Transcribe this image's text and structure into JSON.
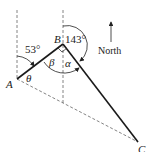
{
  "diagram": {
    "points": {
      "A": {
        "label": "A",
        "x": 17,
        "y": 79
      },
      "B": {
        "label": "B",
        "x": 63,
        "y": 44
      },
      "C": {
        "label": "C",
        "x": 138,
        "y": 142
      }
    },
    "angles": {
      "bearing_AB": "53°",
      "bearing_BC": "143°",
      "theta": "θ",
      "beta": "β",
      "alpha": "α"
    },
    "compass": {
      "label": "North"
    },
    "colors": {
      "solid": "#1a1a1a",
      "dashed": "#555555"
    }
  }
}
